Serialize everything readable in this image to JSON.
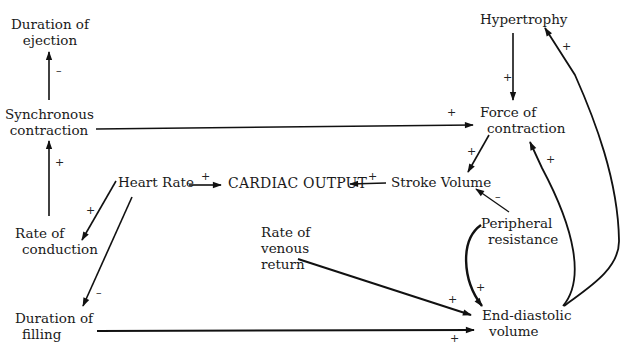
{
  "nodes": {
    "duration_of_ejection": {
      "lines": [
        "Duration of",
        "ejection"
      ]
    },
    "synchronous_contraction": {
      "lines": [
        "Synchronous",
        "contraction"
      ]
    },
    "rate_of_conduction": {
      "lines": [
        "Rate of",
        "conduction"
      ]
    },
    "duration_of_filling": {
      "lines": [
        "Duration of",
        "filling"
      ]
    },
    "heart_rate": {
      "lines": [
        "Heart Rate"
      ]
    },
    "cardiac_output": {
      "lines": [
        "CARDIAC OUTPUT"
      ]
    },
    "stroke_volume": {
      "lines": [
        "Stroke Volume"
      ]
    },
    "rate_of_venous_return": {
      "lines": [
        "Rate of",
        "venous",
        "return"
      ]
    },
    "hypertrophy": {
      "lines": [
        "Hypertrophy"
      ]
    },
    "force_of_contraction": {
      "lines": [
        "Force of",
        "contraction"
      ]
    },
    "peripheral_resistance": {
      "lines": [
        "Peripheral",
        "resistance"
      ]
    },
    "end_diastolic_volume": {
      "lines": [
        "End-diastolic",
        "volume"
      ]
    }
  },
  "edges": [
    {
      "from": "Synchronous contraction",
      "to": "Duration of ejection",
      "sign": "–"
    },
    {
      "from": "Rate of conduction",
      "to": "Synchronous contraction",
      "sign": "+"
    },
    {
      "from": "Synchronous contraction",
      "to": "Force of contraction",
      "sign": "+"
    },
    {
      "from": "Heart Rate",
      "to": "Rate of conduction",
      "sign": "+"
    },
    {
      "from": "Heart Rate",
      "to": "Duration of filling",
      "sign": "–"
    },
    {
      "from": "Heart Rate",
      "to": "CARDIAC OUTPUT",
      "sign": "+"
    },
    {
      "from": "Stroke Volume",
      "to": "CARDIAC OUTPUT",
      "sign": "+"
    },
    {
      "from": "Hypertrophy",
      "to": "Force of contraction",
      "sign": "+"
    },
    {
      "from": "Force of contraction",
      "to": "Stroke Volume",
      "sign": "+"
    },
    {
      "from": "Peripheral resistance",
      "to": "Stroke Volume",
      "sign": "–"
    },
    {
      "from": "Peripheral resistance",
      "to": "End-diastolic volume",
      "sign": "+"
    },
    {
      "from": "Rate of venous return",
      "to": "End-diastolic volume",
      "sign": "+"
    },
    {
      "from": "Duration of filling",
      "to": "End-diastolic volume",
      "sign": "+"
    },
    {
      "from": "End-diastolic volume",
      "to": "Force of contraction",
      "sign": "+"
    },
    {
      "from": "End-diastolic volume",
      "to": "Hypertrophy",
      "sign": "+"
    }
  ],
  "signs": {
    "ejection_minus": "–",
    "conduction_plus": "+",
    "sync_force_plus": "+",
    "hr_conduction_plus": "+",
    "hr_filling_minus": "–",
    "hr_co_plus": "+",
    "sv_co_plus": "+",
    "hyper_force_plus": "+",
    "force_sv_plus": "+",
    "pr_sv_minus": "–",
    "pr_edv_plus": "+",
    "venous_edv_plus": "+",
    "filling_edv_plus": "+",
    "edv_force_plus": "+",
    "edv_hyper_plus": "+"
  }
}
